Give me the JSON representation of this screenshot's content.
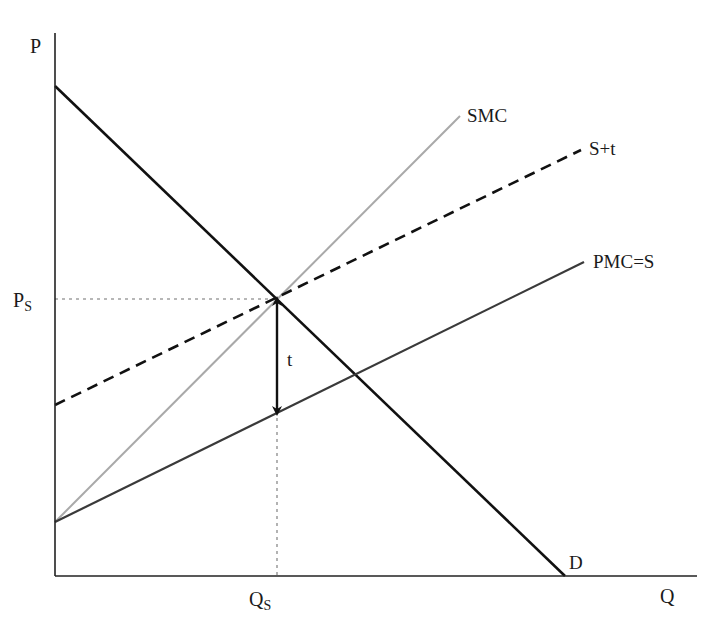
{
  "axes": {
    "y_label": "P",
    "x_label": "Q",
    "origin": [
      55,
      576
    ],
    "y_top": 33,
    "x_right": 697
  },
  "curves": [
    {
      "id": "demand",
      "label": "D",
      "x1": 55,
      "y1": 86,
      "x2": 565,
      "y2": 576,
      "color": "#111111",
      "width": 2.6,
      "dash": "",
      "label_x": 569,
      "label_y": 569
    },
    {
      "id": "smc",
      "label": "SMC",
      "x1": 55,
      "y1": 522,
      "x2": 460,
      "y2": 116,
      "color": "#a9a9a9",
      "width": 2,
      "dash": "",
      "label_x": 467,
      "label_y": 122
    },
    {
      "id": "supply_tax",
      "label": "S+t",
      "x1": 55,
      "y1": 405,
      "x2": 581,
      "y2": 150,
      "color": "#111111",
      "width": 2.6,
      "dash": "11,7",
      "label_x": 589,
      "label_y": 155
    },
    {
      "id": "pmc",
      "label": "PMC=S",
      "x1": 55,
      "y1": 522,
      "x2": 584,
      "y2": 262,
      "color": "#3a3a3a",
      "width": 2.2,
      "dash": "",
      "label_x": 593,
      "label_y": 268
    }
  ],
  "equilibrium": {
    "x": 277,
    "y": 299
  },
  "guides": {
    "price_label": "P",
    "price_sub": "S",
    "quantity_label": "Q",
    "quantity_sub": "S",
    "color": "#a0a0a0"
  },
  "tax_arrow": {
    "label": "t",
    "x": 277,
    "y_top": 299,
    "y_bottom": 413
  },
  "chart_data": {
    "type": "line",
    "title": "",
    "xlabel": "Q",
    "ylabel": "P",
    "series": [
      {
        "name": "D",
        "points": [
          [
            0,
            490
          ],
          [
            510,
            0
          ]
        ],
        "style": "solid black"
      },
      {
        "name": "SMC",
        "points": [
          [
            0,
            54
          ],
          [
            405,
            460
          ]
        ],
        "style": "solid light gray"
      },
      {
        "name": "S+t",
        "points": [
          [
            0,
            171
          ],
          [
            526,
            426
          ]
        ],
        "style": "dashed black"
      },
      {
        "name": "PMC=S",
        "points": [
          [
            0,
            54
          ],
          [
            529,
            314
          ]
        ],
        "style": "solid dark gray"
      }
    ],
    "annotations": [
      {
        "text": "P_S",
        "at": [
          0,
          277
        ],
        "type": "dotted horizontal guide"
      },
      {
        "text": "Q_S",
        "at": [
          222,
          0
        ],
        "type": "dotted vertical guide"
      },
      {
        "text": "t",
        "from": [
          222,
          277
        ],
        "to": [
          222,
          163
        ],
        "type": "double arrow (tax wedge)"
      }
    ],
    "grid": false,
    "legend": "none (curves labelled at right ends)"
  }
}
